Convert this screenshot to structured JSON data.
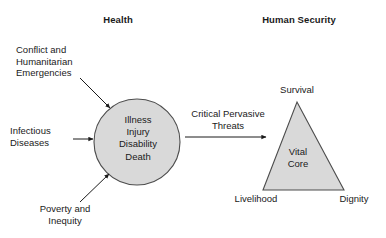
{
  "headings": {
    "left": "Health",
    "right": "Human Security"
  },
  "drivers": [
    {
      "name": "conflict",
      "text": "Conflict and\nHumanitarian\nEmergencies"
    },
    {
      "name": "infectious",
      "text": "Infectious\nDiseases"
    },
    {
      "name": "poverty",
      "text": "Poverty and\nInequity"
    }
  ],
  "circle": {
    "label": "Illness\nInjury\nDisability\nDeath",
    "fill": "#d9d9d9",
    "stroke": "#4d4d4d",
    "cx": 137,
    "cy": 142,
    "r": 43
  },
  "bridge": {
    "label": "Critical Pervasive\nThreats"
  },
  "triangle": {
    "center_label": "Vital\nCore",
    "apex_label": "Survival",
    "left_label": "Livelihood",
    "right_label": "Dignity",
    "fill": "#d9d9d9",
    "stroke": "#4d4d4d",
    "apex": {
      "x": 297,
      "y": 102
    },
    "left": {
      "x": 263,
      "y": 190
    },
    "right": {
      "x": 344,
      "y": 190
    }
  },
  "arrows": [
    {
      "name": "arrow-conflict-to-circle",
      "x1": 80,
      "y1": 78,
      "x2": 112,
      "y2": 110
    },
    {
      "name": "arrow-infectious-to-circle",
      "x1": 72,
      "y1": 139,
      "x2": 95,
      "y2": 139
    },
    {
      "name": "arrow-poverty-to-circle",
      "x1": 80,
      "y1": 203,
      "x2": 110,
      "y2": 175
    },
    {
      "name": "arrow-circle-to-triangle",
      "x1": 185,
      "y1": 137,
      "x2": 268,
      "y2": 137
    }
  ],
  "colors": {
    "shape_fill": "#d9d9d9",
    "shape_stroke": "#4d4d4d",
    "arrow": "#1a1a1a",
    "text": "#1a1a1a",
    "background": "#ffffff"
  }
}
